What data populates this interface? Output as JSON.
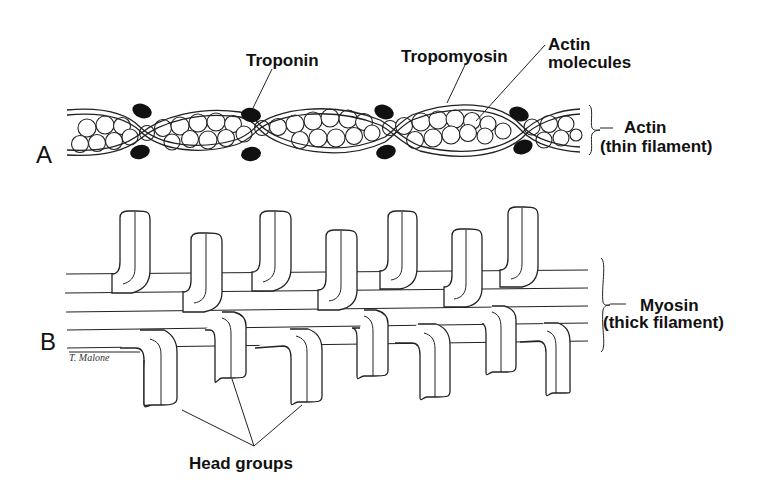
{
  "figure": {
    "panel_a": {
      "letter": "A",
      "labels": {
        "troponin": "Troponin",
        "tropomyosin": "Tropomyosin",
        "actin_molecules_line1": "Actin",
        "actin_molecules_line2": "molecules",
        "actin_line1": "Actin",
        "actin_line2": "(thin filament)"
      }
    },
    "panel_b": {
      "letter": "B",
      "labels": {
        "myosin_line1": "Myosin",
        "myosin_line2": "(thick filament)",
        "head_groups": "Head groups"
      }
    },
    "signature": "T. Malone"
  },
  "colors": {
    "ink": "#111111",
    "background": "#ffffff"
  }
}
